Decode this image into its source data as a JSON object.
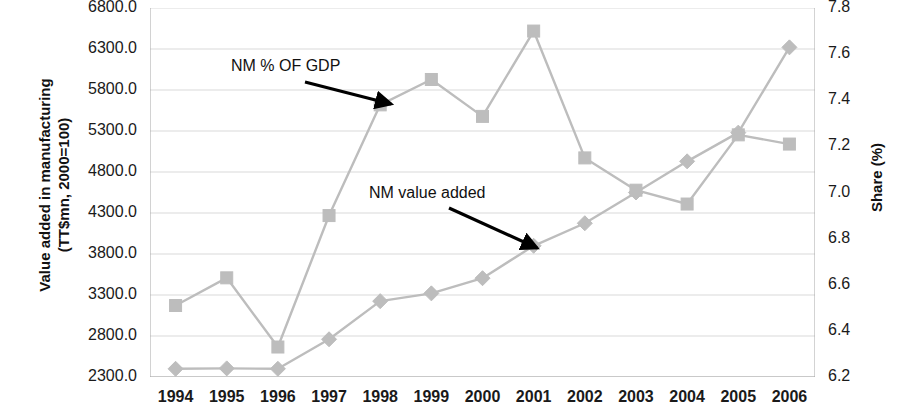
{
  "chart_data": {
    "type": "line",
    "title": "",
    "subtitle": "",
    "categories": [
      "1994",
      "1995",
      "1996",
      "1997",
      "1998",
      "1999",
      "2000",
      "2001",
      "2002",
      "2003",
      "2004",
      "2005",
      "2006"
    ],
    "x": [
      1994,
      1995,
      1996,
      1997,
      1998,
      1999,
      2000,
      2001,
      2002,
      2003,
      2004,
      2005,
      2006
    ],
    "xlabel": "",
    "grid": true,
    "legend_position": "none",
    "series": [
      {
        "name": "NM value added",
        "axis": "left",
        "marker": "diamond",
        "color": "#bdbdbd",
        "values": [
          2400,
          2405,
          2400,
          2760,
          3225,
          3320,
          3505,
          3900,
          4175,
          4550,
          4930,
          5280,
          6320
        ]
      },
      {
        "name": "NM % OF GDP",
        "axis": "right",
        "marker": "square",
        "color": "#bdbdbd",
        "values": [
          6.51,
          6.63,
          6.33,
          6.9,
          7.38,
          7.49,
          7.33,
          7.7,
          7.15,
          7.01,
          6.95,
          7.25,
          7.21
        ]
      }
    ],
    "left_axis": {
      "label": "Value added in manufacturing\n(TT$mn, 2000=100)",
      "ticks": [
        "2300.0",
        "2800.0",
        "3300.0",
        "3800.0",
        "4300.0",
        "4800.0",
        "5300.0",
        "5800.0",
        "6300.0",
        "6800.0"
      ],
      "tick_values": [
        2300,
        2800,
        3300,
        3800,
        4300,
        4800,
        5300,
        5800,
        6300,
        6800
      ],
      "ylim": [
        2300,
        6800
      ]
    },
    "right_axis": {
      "label": "Share (%)",
      "ticks": [
        "6.2",
        "6.4",
        "6.6",
        "6.8",
        "7.0",
        "7.2",
        "7.4",
        "7.6",
        "7.8"
      ],
      "tick_values": [
        6.2,
        6.4,
        6.6,
        6.8,
        7.0,
        7.2,
        7.4,
        7.6,
        7.8
      ],
      "ylim": [
        6.2,
        7.8
      ]
    },
    "annotations": [
      {
        "text": "NM % OF GDP",
        "from": [
          305,
          82
        ],
        "to": [
          391,
          104
        ]
      },
      {
        "text": "NM value added",
        "from": [
          449,
          208
        ],
        "to": [
          537,
          248
        ]
      }
    ]
  },
  "labels": {
    "y_left_title": "Value added in manufacturing\n(TT$mn, 2000=100)",
    "y_right_title": "Share (%)",
    "annotation_gdp": "NM % OF GDP",
    "annotation_value_added": "NM value added"
  },
  "colors": {
    "series": "#bdbdbd",
    "grid": "#d9d9d9",
    "axis": "#a6a6a6",
    "text": "#1a1a1a",
    "arrow": "#000000",
    "background": "#ffffff"
  }
}
